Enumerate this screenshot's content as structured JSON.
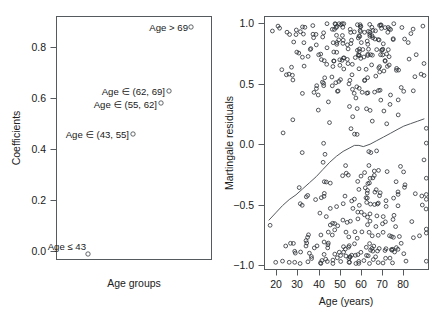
{
  "figure": {
    "width": 442,
    "height": 319,
    "background": "#ffffff",
    "ink": "#202020"
  },
  "chart_data": [
    {
      "type": "scatter",
      "id": "coefficients-panel",
      "title": "",
      "xlabel": "Age groups",
      "ylabel": "Coefficients",
      "xlim": [
        0,
        1
      ],
      "ylim": [
        -0.04,
        0.93
      ],
      "grid": false,
      "legend": false,
      "xticks": [],
      "xticklabels": [],
      "yticks": [
        0.0,
        0.2,
        0.4,
        0.6,
        0.8
      ],
      "yticklabels": [
        "0.0",
        "0.2",
        "0.4",
        "0.6",
        "0.8"
      ],
      "categories": [
        "Age ≤ 43",
        "Age ∈ (43, 55]",
        "Age ∈ (55, 62]",
        "Age ∈ (62, 69]",
        "Age > 69"
      ],
      "values": [
        0.0,
        0.46,
        0.58,
        0.63,
        0.88
      ],
      "points": [
        {
          "label": "Age ≤ 43",
          "x": 0.21,
          "y": 0.0,
          "label_dx": -2,
          "label_dy": -8,
          "label_anchor": "end",
          "marker": "open-circle"
        },
        {
          "label": "Age ∈ (43, 55]",
          "x": 0.5,
          "y": 0.46,
          "label_dx": -4,
          "label_dy": 4,
          "label_anchor": "end",
          "marker": "open-circle"
        },
        {
          "label": "Age ∈ (55, 62]",
          "x": 0.68,
          "y": 0.58,
          "label_dx": -4,
          "label_dy": 5,
          "label_anchor": "end",
          "marker": "open-circle"
        },
        {
          "label": "Age ∈ (62, 69]",
          "x": 0.73,
          "y": 0.63,
          "label_dx": -4,
          "label_dy": 4,
          "label_anchor": "end",
          "marker": "open-circle"
        },
        {
          "label": "Age > 69",
          "x": 0.87,
          "y": 0.88,
          "label_dx": -3,
          "label_dy": 4,
          "label_anchor": "end",
          "marker": "open-circle"
        }
      ]
    },
    {
      "type": "scatter",
      "id": "martingale-panel",
      "title": "",
      "xlabel": "Age (years)",
      "ylabel": "Martingale residuals",
      "xlim": [
        15,
        88
      ],
      "ylim": [
        -1.05,
        1.05
      ],
      "grid": false,
      "legend": false,
      "xticks": [
        20,
        30,
        40,
        50,
        60,
        70,
        80
      ],
      "xticklabels": [
        "20",
        "30",
        "40",
        "50",
        "60",
        "70",
        "80"
      ],
      "yticks": [
        -1.0,
        -0.5,
        0.0,
        0.5,
        1.0
      ],
      "yticklabels": [
        "−1.0",
        "−0.5",
        "0.0",
        "0.5",
        "1.0"
      ],
      "smoother": {
        "name": "lowess",
        "x": [
          17,
          20,
          23,
          26,
          29,
          32,
          35,
          38,
          41,
          44,
          47,
          50,
          53,
          55,
          57,
          59,
          62,
          65,
          68,
          71,
          74,
          77,
          80,
          83,
          86
        ],
        "y": [
          -0.64,
          -0.58,
          -0.52,
          -0.47,
          -0.43,
          -0.38,
          -0.33,
          -0.28,
          -0.22,
          -0.16,
          -0.11,
          -0.07,
          -0.04,
          -0.02,
          -0.02,
          -0.03,
          -0.01,
          0.02,
          0.05,
          0.08,
          0.11,
          0.14,
          0.16,
          0.18,
          0.2
        ]
      },
      "n_points": 430
    }
  ]
}
